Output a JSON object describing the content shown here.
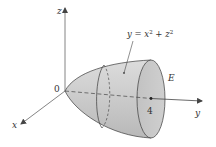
{
  "figure": {
    "type": "3d-paraboloid-diagram",
    "axes": {
      "x_label": "x",
      "y_label": "y",
      "z_label": "z",
      "origin_label": "0"
    },
    "tick": {
      "y_value_label": "4"
    },
    "surface": {
      "equation_y": "y",
      "equation_eq": " = ",
      "equation_x": "x",
      "equation_plus": " + ",
      "equation_z": "z",
      "exponent": "2",
      "region_label": "E"
    },
    "colors": {
      "surface_fill": "#c9c9c9",
      "surface_light": "#e3e3e3",
      "cap_fill": "#bdbdbd",
      "stroke": "#3a3a3a",
      "axis": "#555555",
      "text": "#333333"
    }
  }
}
